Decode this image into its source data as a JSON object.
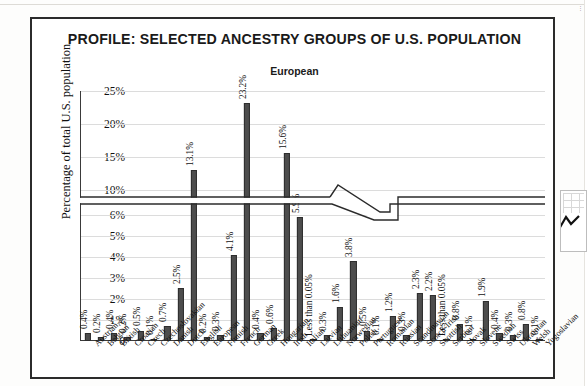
{
  "figure": {
    "title": "PROFILE: SELECTED ANCESTRY GROUPS OF U.S. POPULATION",
    "subtitle": "European",
    "y_axis_title": "Percentage of total U.S. population"
  },
  "colors": {
    "bar_fill": "#4d4d4d",
    "bar_stroke": "#2e2e2e",
    "frame": "#2b2b2b",
    "grid": "#dcdcdc",
    "text": "#111111"
  },
  "chart_data": {
    "type": "bar",
    "title": "PROFILE: SELECTED ANCESTRY GROUPS OF U.S. POPULATION",
    "subtitle": "European",
    "xlabel": "",
    "ylabel": "Percentage of total U.S. population",
    "grid": true,
    "legend": "none",
    "axis_break": {
      "present": true,
      "lower_range": [
        0,
        6.5
      ],
      "upper_range": [
        9.0,
        25.0
      ],
      "note": "y-axis is broken between the 6% region and the 10% tick"
    },
    "ytick_labels": [
      "0",
      "1%",
      "2%",
      "3%",
      "4%",
      "5%",
      "6%",
      "10%",
      "15%",
      "20%",
      "25%"
    ],
    "ytick_values": [
      0,
      1,
      2,
      3,
      4,
      5,
      6,
      10,
      15,
      20,
      25
    ],
    "categories": [
      "Austrian",
      "Belgian",
      "British",
      "Croatian",
      "Czech",
      "Czechoslovakian",
      "Danish",
      "Dutch",
      "English",
      "European",
      "Finnish",
      "French",
      "German",
      "Greek",
      "Hungarian",
      "Irish",
      "Italian",
      "Latvian",
      "Lithuanian",
      "Norwegian",
      "Polish",
      "Portuguese",
      "Romanian",
      "Russian",
      "Scandinavian",
      "Scotch-Irish",
      "Scottish",
      "Serbian",
      "Slovak",
      "Slovene",
      "Swedish",
      "Swiss",
      "Ukrainian",
      "Welsh",
      "Yugoslavian"
    ],
    "values": [
      0.4,
      0.2,
      0.4,
      0.2,
      0.5,
      0.1,
      0.7,
      2.5,
      13.1,
      0.2,
      0.3,
      4.1,
      23.2,
      0.4,
      0.6,
      15.6,
      5.9,
      0.04,
      0.3,
      1.6,
      3.8,
      0.5,
      0.1,
      1.2,
      0.3,
      2.3,
      2.2,
      0.04,
      0.8,
      0.1,
      1.9,
      0.4,
      0.3,
      0.8,
      0.1
    ],
    "data_labels": [
      "0.4%",
      "0.2%",
      "0.4%",
      "0.2%",
      "0.5%",
      "0.1%",
      "0.7%",
      "2.5%",
      "13.1%",
      "0.2%",
      "0.3%",
      "4.1%",
      "23.2%",
      "0.4%",
      "0.6%",
      "15.6%",
      "5.9%",
      "Less than 0.05%",
      "0.3%",
      "1.6%",
      "3.8%",
      "0.5%",
      "0.1%",
      "1.2%",
      "0.3%",
      "2.3%",
      "2.2%",
      "Less than 0.05%",
      "0.8%",
      "0.1%",
      "1.9%",
      "0.4%",
      "0.3%",
      "0.8%",
      "0.1%"
    ]
  }
}
